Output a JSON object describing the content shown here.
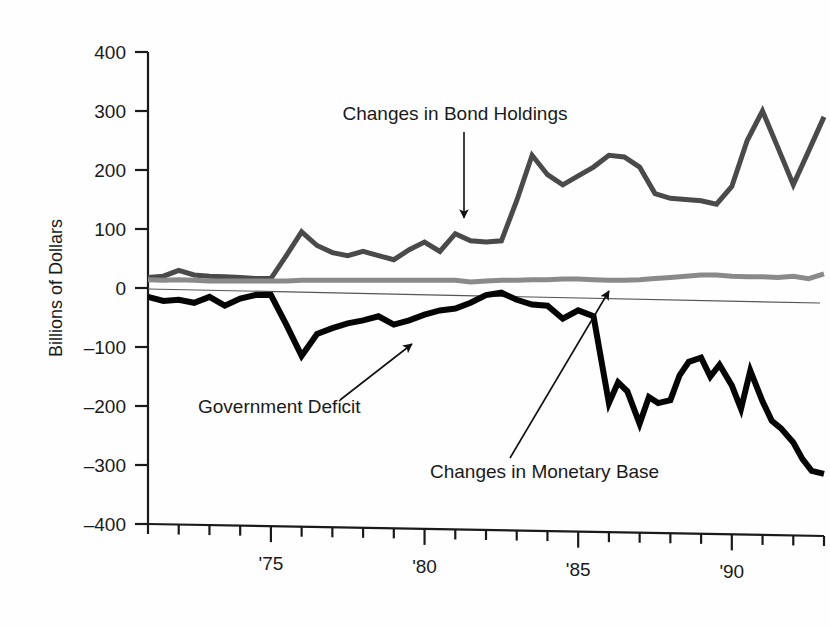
{
  "chart_data": {
    "type": "line",
    "title": "",
    "subtitle": "",
    "xlabel": "",
    "ylabel": "Billions of Dollars",
    "xlim": [
      1971,
      1993
    ],
    "ylim": [
      -400,
      400
    ],
    "grid": false,
    "legend_position": "inline-annotations",
    "y_ticks": [
      400,
      300,
      200,
      100,
      0,
      -100,
      -200,
      -300,
      -400
    ],
    "y_tick_labels": [
      "400",
      "300",
      "200",
      "100",
      "0",
      "–100",
      "–200",
      "–300",
      "–400"
    ],
    "x_ticks": [
      1971,
      1972,
      1973,
      1974,
      1975,
      1976,
      1977,
      1978,
      1979,
      1980,
      1981,
      1982,
      1983,
      1984,
      1985,
      1986,
      1987,
      1988,
      1989,
      1990,
      1991,
      1992,
      1993
    ],
    "x_tick_labels": [
      {
        "x": 1975,
        "label": "'75"
      },
      {
        "x": 1980,
        "label": "'80"
      },
      {
        "x": 1985,
        "label": "'85"
      },
      {
        "x": 1990,
        "label": "'90"
      }
    ],
    "x": [
      1971,
      1971.5,
      1972,
      1972.5,
      1973,
      1973.5,
      1974,
      1974.5,
      1975,
      1975.5,
      1976,
      1976.5,
      1977,
      1977.5,
      1978,
      1978.5,
      1979,
      1979.5,
      1980,
      1980.5,
      1981,
      1981.5,
      1982,
      1982.5,
      1983,
      1983.5,
      1984,
      1984.5,
      1985,
      1985.5,
      1986,
      1986.5,
      1987,
      1987.5,
      1988,
      1988.5,
      1989,
      1989.5,
      1990,
      1990.5,
      1991,
      1991.5,
      1992,
      1992.5,
      1993
    ],
    "series": [
      {
        "name": "Changes in Bond Holdings",
        "color": "#4a4a4a",
        "width": 5,
        "values": [
          18,
          20,
          30,
          22,
          20,
          19,
          18,
          16,
          16,
          55,
          95,
          72,
          60,
          55,
          62,
          55,
          48,
          65,
          78,
          62,
          92,
          80,
          78,
          80,
          148,
          225,
          192,
          175,
          190,
          205,
          225,
          222,
          205,
          160,
          152,
          150,
          148,
          142,
          172,
          250,
          300,
          238,
          175,
          232,
          290
        ]
      },
      {
        "name": "Changes in Monetary Base",
        "color": "#8a8a8a",
        "width": 5,
        "values": [
          14,
          13,
          14,
          13,
          12,
          12,
          12,
          12,
          12,
          12,
          13,
          13,
          13,
          13,
          13,
          13,
          13,
          13,
          13,
          13,
          13,
          10,
          12,
          13,
          13,
          14,
          14,
          15,
          15,
          14,
          13,
          13,
          14,
          16,
          18,
          20,
          22,
          22,
          20,
          19,
          19,
          18,
          20,
          16,
          24
        ]
      },
      {
        "name": "Government Deficit",
        "color": "#050505",
        "width": 6,
        "values": [
          -15,
          -22,
          -20,
          -25,
          -15,
          -30,
          -18,
          -12,
          -12,
          -62,
          -115,
          -78,
          -68,
          -60,
          -55,
          -48,
          -62,
          -55,
          -45,
          -38,
          -35,
          -25,
          -12,
          -8,
          -20,
          -28,
          -30,
          -52,
          -38,
          -48,
          -105,
          -150,
          -190,
          -195,
          -188,
          -175,
          -200,
          -178,
          -208,
          -198,
          -170,
          -128,
          -125,
          -150,
          -150
        ]
      }
    ],
    "series_extension": {
      "note": "Government Deficit continues past 1989 with high-frequency oscillation, then a steep decline to about -315 at 1993.",
      "late_x": [
        1986,
        1986.3,
        1986.6,
        1987,
        1987.3,
        1987.6,
        1988,
        1988.3,
        1988.6,
        1989,
        1989.3,
        1989.6,
        1990,
        1990.3,
        1990.6,
        1991,
        1991.3,
        1991.6,
        1992,
        1992.3,
        1992.6,
        1993
      ],
      "late_values": [
        -195,
        -160,
        -175,
        -230,
        -185,
        -195,
        -190,
        -148,
        -125,
        -118,
        -150,
        -130,
        -165,
        -205,
        -140,
        -192,
        -225,
        -238,
        -262,
        -290,
        -310,
        -315
      ]
    },
    "annotations": [
      {
        "text": "Changes in Bond Holdings",
        "label_x": 455,
        "label_y": 120,
        "anchor": "middle",
        "arrow": {
          "x1": 464,
          "y1": 132,
          "x2": 464,
          "y2": 218
        },
        "arrow_style": "straight-down"
      },
      {
        "text": "Government Deficit",
        "label_x": 198,
        "label_y": 413,
        "anchor": "start",
        "arrow": {
          "x1": 340,
          "y1": 400,
          "x2": 412,
          "y2": 344
        },
        "arrow_style": "diagonal-up-right"
      },
      {
        "text": "Changes in Monetary Base",
        "label_x": 430,
        "label_y": 478,
        "anchor": "start",
        "arrow": {
          "x1": 510,
          "y1": 458,
          "x2": 609,
          "y2": 291
        },
        "arrow_style": "diagonal-up-right-long"
      }
    ]
  },
  "figure": {
    "background": "#fefefe",
    "axis_color": "#1a1a1a",
    "zero_line_color": "#555555",
    "y_axis_title": "Billions of Dollars"
  }
}
